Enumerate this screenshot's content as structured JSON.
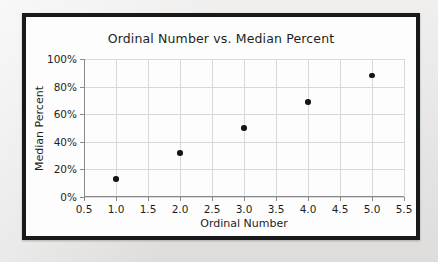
{
  "page": {
    "background_color": "#ebebeb",
    "frame_color": "#17191a",
    "card_color": "#fdfdfd"
  },
  "chart_data": {
    "type": "scatter",
    "title": "Ordinal Number vs. Median Percent",
    "xlabel": "Ordinal Number",
    "ylabel": "Median Percent",
    "x": [
      1.0,
      2.0,
      3.0,
      4.0,
      5.0
    ],
    "values": [
      13,
      32,
      50,
      69,
      88
    ],
    "point_labels": [
      "13%",
      "32%",
      "50%",
      "69%",
      "88%"
    ],
    "xlim": [
      0.5,
      5.5
    ],
    "ylim": [
      0,
      100
    ],
    "xticks": [
      0.5,
      1.0,
      1.5,
      2.0,
      2.5,
      3.0,
      3.5,
      4.0,
      4.5,
      5.0,
      5.5
    ],
    "xticklabels": [
      "0.5",
      "1.0",
      "1.5",
      "2.0",
      "2.5",
      "3.0",
      "3.5",
      "4.0",
      "4.5",
      "5.0",
      "5.5"
    ],
    "yticks": [
      0,
      20,
      40,
      60,
      80,
      100
    ],
    "yticklabels": [
      "0%",
      "20%",
      "40%",
      "60%",
      "80%",
      "100%"
    ],
    "grid": true,
    "grid_color": "#d8d8d8",
    "marker_color": "#151515",
    "marker_shape": "circle",
    "legend": null,
    "legend_position": "none"
  }
}
